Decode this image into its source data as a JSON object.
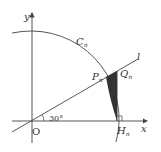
{
  "diagram": {
    "labels": {
      "x_axis": "x",
      "y_axis": "y",
      "origin": "O",
      "curve": "C",
      "curve_sub": "n",
      "line": "l",
      "point_p": "P",
      "point_p_sub": "n",
      "point_q": "Q",
      "point_q_sub": "n",
      "point_h": "H",
      "point_h_sub": "n",
      "angle": "30°"
    },
    "colors": {
      "stroke": "#444444",
      "shaded": "#333333",
      "background": "#ffffff"
    }
  }
}
